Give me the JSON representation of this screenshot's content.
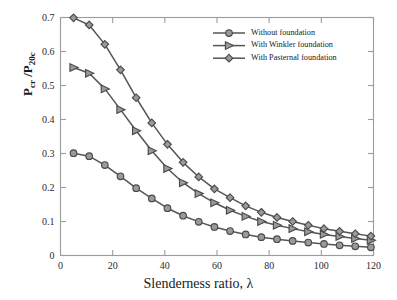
{
  "chart_data": {
    "type": "line",
    "title": "",
    "xlabel": "Slenderness ratio, λ",
    "ylabel": "P_cr /P_20c",
    "ylabel_parts": {
      "main1": "P",
      "sub1": "cr",
      "mid": " /P",
      "sub2": "20c"
    },
    "xlim": [
      0,
      120
    ],
    "ylim": [
      0,
      0.7
    ],
    "xticks": [
      0,
      20,
      40,
      60,
      80,
      100,
      120
    ],
    "xtick_labels": [
      "0",
      "20",
      "40",
      "60",
      "80",
      "100",
      "120"
    ],
    "yticks": [
      0,
      0.1,
      0.2,
      0.3,
      0.4,
      0.5,
      0.6,
      0.7
    ],
    "ytick_labels": [
      "0",
      "0.1",
      "0.2",
      "0.3",
      "0.4",
      "0.5",
      "0.6",
      "0.7"
    ],
    "grid": false,
    "legend_position": "top-right",
    "x": [
      5,
      11,
      17,
      23,
      29,
      35,
      41,
      47,
      53,
      59,
      65,
      71,
      77,
      83,
      89,
      95,
      101,
      107,
      113,
      119
    ],
    "series": [
      {
        "name": "Without foundation",
        "marker": "circle",
        "line_color": "#555555",
        "marker_face": "#9a9a9a",
        "marker_edge": "#4a4a4a",
        "values": [
          0.301,
          0.292,
          0.266,
          0.233,
          0.198,
          0.168,
          0.139,
          0.117,
          0.099,
          0.084,
          0.072,
          0.062,
          0.054,
          0.048,
          0.043,
          0.038,
          0.034,
          0.03,
          0.027,
          0.024
        ]
      },
      {
        "name": "With Winkler foundation",
        "marker": "triangle-right",
        "line_color": "#555555",
        "marker_face": "#9a9a9a",
        "marker_edge": "#4a4a4a",
        "values": [
          0.553,
          0.536,
          0.49,
          0.429,
          0.367,
          0.308,
          0.256,
          0.214,
          0.182,
          0.155,
          0.133,
          0.115,
          0.1,
          0.089,
          0.079,
          0.07,
          0.062,
          0.056,
          0.05,
          0.045
        ]
      },
      {
        "name": "With Pasternal foundation",
        "marker": "diamond",
        "line_color": "#555555",
        "marker_face": "#9a9a9a",
        "marker_edge": "#4a4a4a",
        "values": [
          0.699,
          0.678,
          0.621,
          0.546,
          0.464,
          0.39,
          0.327,
          0.274,
          0.231,
          0.196,
          0.17,
          0.146,
          0.127,
          0.112,
          0.1,
          0.089,
          0.079,
          0.071,
          0.064,
          0.057
        ]
      }
    ]
  },
  "legend": {
    "items": [
      {
        "label": "Without foundation",
        "marker": "circle"
      },
      {
        "label": "With Winkler foundation",
        "marker": "triangle-right"
      },
      {
        "label": "With Pasternal foundation",
        "marker": "diamond"
      }
    ]
  },
  "axes": {
    "x_axis_label": "Slenderness ratio, λ",
    "y_axis_label_main": "P",
    "y_axis_label_sub1": "cr",
    "y_axis_label_mid": " /P",
    "y_axis_label_sub2": "20c"
  },
  "colors": {
    "line": "#555555",
    "marker_face": "#9a9a9a",
    "marker_edge": "#4a4a4a",
    "axis": "#9c9c9c",
    "text": "#1a1a1a",
    "background": "#ffffff"
  }
}
